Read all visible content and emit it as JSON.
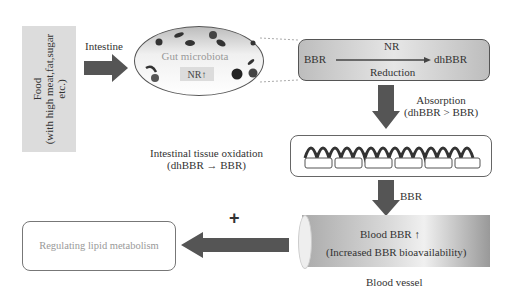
{
  "food": {
    "line1": "Food",
    "line2": "(with high meat,fat,sugar",
    "line3": "etc.)"
  },
  "arrow_intestine_label": "Intestine",
  "gut": {
    "title": "Gut microbiota",
    "nr": "NR",
    "nr_arrow": "↑"
  },
  "reduction": {
    "left": "BBR",
    "top": "NR",
    "bottom": "Reduction",
    "right": "dhBBR"
  },
  "absorption": {
    "line1": "Absorption",
    "line2": "(dhBBR > BBR)"
  },
  "oxidation": {
    "line1": "Intestinal tissue oxidation",
    "line2": "(dhBBR → BBR)"
  },
  "bbr_label": "BBR",
  "vessel": {
    "line1": "Blood BBR",
    "arrow": "↑",
    "line2": "(Increased BBR bioavailability)",
    "caption": "Blood vessel"
  },
  "plus": "+",
  "lipid": {
    "text": "Regulating lipid metabolism"
  },
  "colors": {
    "arrow": "#555555",
    "box_fill": "#dcdcdc",
    "text": "#333333",
    "lipid_text": "#999999"
  }
}
